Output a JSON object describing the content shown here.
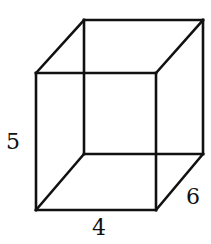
{
  "figure": {
    "type": "rectangular prism wireframe",
    "line_color": "#111111",
    "background": "#ffffff",
    "vertices": {
      "front_top_left": [
        36,
        73
      ],
      "front_top_right": [
        156,
        73
      ],
      "front_bottom_left": [
        36,
        210
      ],
      "front_bottom_right": [
        156,
        210
      ],
      "back_top_left": [
        84,
        20
      ],
      "back_top_right": [
        203,
        20
      ],
      "back_bottom_left": [
        84,
        154
      ],
      "back_bottom_right": [
        203,
        154
      ]
    },
    "labels": {
      "height": "5",
      "width": "4",
      "depth": "6"
    }
  }
}
